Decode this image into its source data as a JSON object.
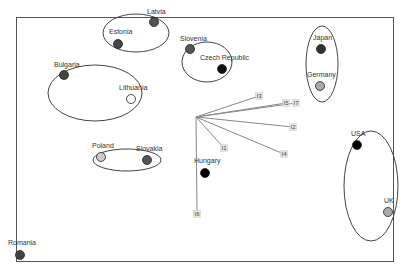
{
  "chart_data": {
    "type": "scatter",
    "title": "",
    "xlabel": "",
    "ylabel": "",
    "grid": false,
    "legend": null,
    "frame": {
      "x1": 16,
      "y1": 17,
      "x2": 393,
      "y2": 261,
      "color": "#555555"
    },
    "points": [
      {
        "name": "Latvia",
        "x": 154,
        "y": 22,
        "fill": "#555555",
        "label_dx": -7,
        "label_dy": -8
      },
      {
        "name": "Estonia",
        "x": 118,
        "y": 44,
        "fill": "#444444",
        "label_dx": -9,
        "label_dy": -10
      },
      {
        "name": "Slovenia",
        "x": 190,
        "y": 49,
        "fill": "#555555",
        "label_dx": -10,
        "label_dy": -8
      },
      {
        "name": "Czech Republic",
        "x": 222,
        "y": 69,
        "fill": "#111111",
        "label_dx": -22,
        "label_dy": -9
      },
      {
        "name": "Bulgaria",
        "x": 64,
        "y": 75,
        "fill": "#444444",
        "label_dx": -10,
        "label_dy": -8
      },
      {
        "name": "Lithuania",
        "x": 131,
        "y": 99,
        "fill": "#ffffff",
        "label_dx": -12,
        "label_dy": -9
      },
      {
        "name": "Japan",
        "x": 321,
        "y": 49,
        "fill": "#333333",
        "label_dx": -8,
        "label_dy": -9
      },
      {
        "name": "Germany",
        "x": 320,
        "y": 86,
        "fill": "#aaaaaa",
        "label_dx": -13,
        "label_dy": -9
      },
      {
        "name": "Poland",
        "x": 101,
        "y": 157,
        "fill": "#cccccc",
        "label_dx": -9,
        "label_dy": -9
      },
      {
        "name": "Slovakia",
        "x": 147,
        "y": 160,
        "fill": "#555555",
        "label_dx": -11,
        "label_dy": -9
      },
      {
        "name": "Hungary",
        "x": 205,
        "y": 173,
        "fill": "#000000",
        "label_dx": -11,
        "label_dy": -10
      },
      {
        "name": "USA",
        "x": 357,
        "y": 145,
        "fill": "#000000",
        "label_dx": -6,
        "label_dy": -9
      },
      {
        "name": "UK",
        "x": 388,
        "y": 212,
        "fill": "#aaaaaa",
        "label_dx": -4,
        "label_dy": -9
      },
      {
        "name": "Romania",
        "x": 20,
        "y": 255,
        "fill": "#444444",
        "label_dx": -12,
        "label_dy": -10
      }
    ],
    "clusters": [
      {
        "members": [
          "Latvia",
          "Estonia"
        ],
        "cx": 136,
        "cy": 33,
        "rx": 33,
        "ry": 19
      },
      {
        "members": [
          "Slovenia",
          "Czech Republic"
        ],
        "cx": 207,
        "cy": 62,
        "rx": 25,
        "ry": 20
      },
      {
        "members": [
          "Bulgaria",
          "Lithuania"
        ],
        "cx": 95,
        "cy": 93,
        "rx": 47,
        "ry": 28
      },
      {
        "members": [
          "Japan",
          "Germany"
        ],
        "cx": 322,
        "cy": 64,
        "rx": 16,
        "ry": 38
      },
      {
        "members": [
          "Poland",
          "Slovakia"
        ],
        "cx": 127,
        "cy": 160,
        "rx": 34,
        "ry": 11
      },
      {
        "members": [
          "USA",
          "UK"
        ],
        "cx": 371,
        "cy": 186,
        "rx": 27,
        "ry": 55
      }
    ],
    "vectors": {
      "origin": {
        "x": 196,
        "y": 117
      },
      "color": "#888888",
      "items": [
        {
          "name": "I3",
          "x": 259,
          "y": 96
        },
        {
          "name": "I5",
          "x": 286,
          "y": 103
        },
        {
          "name": "I7",
          "x": 296,
          "y": 103
        },
        {
          "name": "I2",
          "x": 293,
          "y": 127
        },
        {
          "name": "I4",
          "x": 284,
          "y": 154
        },
        {
          "name": "I1",
          "x": 224,
          "y": 148
        },
        {
          "name": "I6",
          "x": 197,
          "y": 214
        }
      ]
    }
  }
}
